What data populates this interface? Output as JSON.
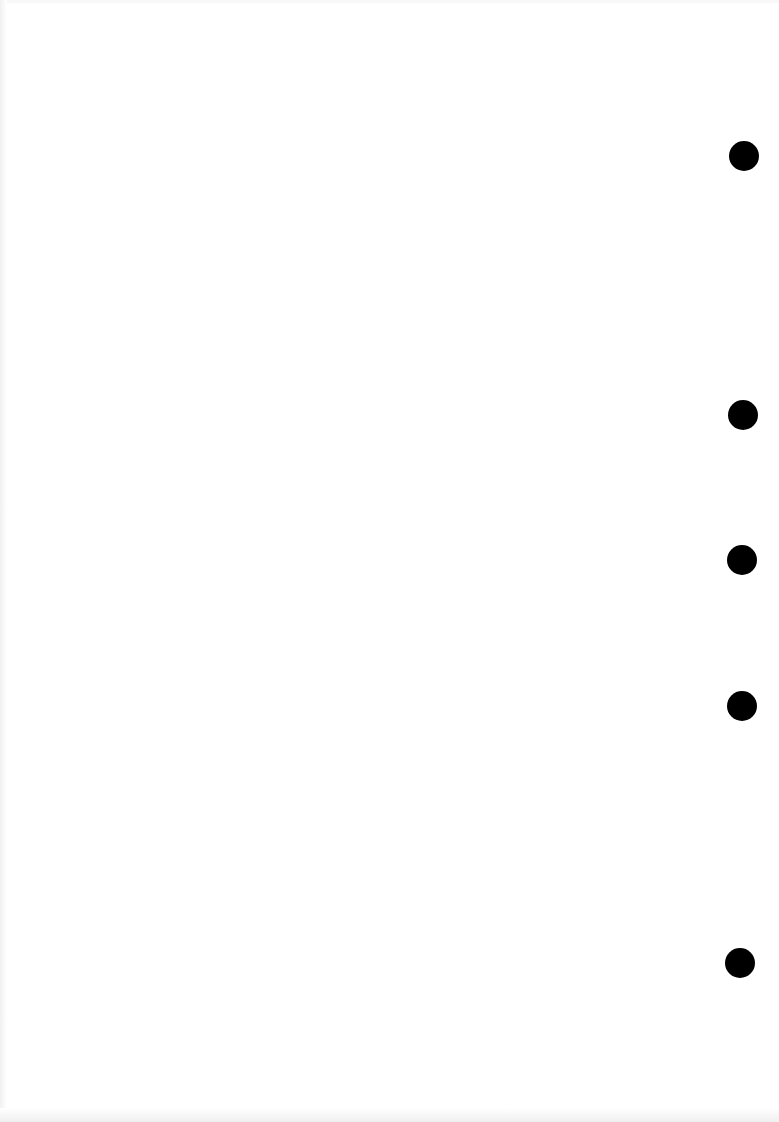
{
  "document": {
    "type": "blank scanned page",
    "text": ""
  },
  "punch_holes": [
    {
      "cx": 744,
      "cy": 156,
      "w": 30,
      "h": 30
    },
    {
      "cx": 743,
      "cy": 415,
      "w": 30,
      "h": 30
    },
    {
      "cx": 742,
      "cy": 560,
      "w": 30,
      "h": 30
    },
    {
      "cx": 742,
      "cy": 706,
      "w": 30,
      "h": 30
    },
    {
      "cx": 740,
      "cy": 963,
      "w": 30,
      "h": 30
    }
  ],
  "colors": {
    "paper": "#ffffff",
    "hole": "#000000"
  }
}
